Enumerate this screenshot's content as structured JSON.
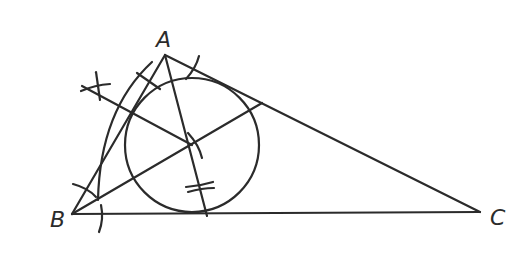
{
  "diagram": {
    "vertices": {
      "A": {
        "label": "A",
        "x": 165,
        "y": 55
      },
      "B": {
        "label": "B",
        "x": 72,
        "y": 214
      },
      "C": {
        "label": "C",
        "x": 480,
        "y": 212
      }
    },
    "incenter": {
      "x": 192,
      "y": 145
    },
    "incircle_radius": 67,
    "stroke_color": "#2b2b2b"
  }
}
